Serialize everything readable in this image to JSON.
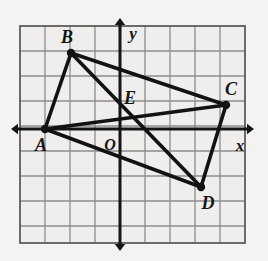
{
  "figure": {
    "kind": "coordinate-plane-quadrilateral",
    "background_color": "#f4f3f1",
    "grid": {
      "border_color": "#5d5d5d",
      "line_color": "#8d8d8d",
      "cell_size_px": 25,
      "left_px": 20,
      "top_px": 26,
      "right_px": 245,
      "bottom_px": 243,
      "columns": 9,
      "rows": 8,
      "show_grid": true
    },
    "axes": {
      "color": "#151515",
      "origin_px": {
        "x": 120,
        "y": 129
      },
      "origin_label": "O",
      "x_axis_label": "x",
      "y_axis_label": "y",
      "x_axis_y_px": 129,
      "y_axis_x_px": 120,
      "arrowheads": [
        "left",
        "right",
        "up",
        "down"
      ]
    },
    "points": [
      {
        "id": "A",
        "label": "A",
        "x_px": 45,
        "y_px": 129,
        "grid_x": -3,
        "grid_y": 0,
        "label_dx": -4,
        "label_dy": 22,
        "dot": true
      },
      {
        "id": "B",
        "label": "B",
        "x_px": 71,
        "y_px": 53,
        "grid_x": -2,
        "grid_y": 3,
        "label_dx": -4,
        "label_dy": -10,
        "dot": true
      },
      {
        "id": "C",
        "label": "C",
        "x_px": 226,
        "y_px": 105,
        "grid_x": 4.2,
        "grid_y": 1,
        "label_dx": 5,
        "label_dy": -10,
        "dot": true
      },
      {
        "id": "D",
        "label": "D",
        "x_px": 201,
        "y_px": 187,
        "grid_x": 3.2,
        "grid_y": -2.3,
        "label_dx": 7,
        "label_dy": 22,
        "dot": true
      },
      {
        "id": "E",
        "label": "E",
        "x_px": 140,
        "y_px": 110,
        "grid_x": 0.8,
        "grid_y": 0.75,
        "label_dx": -10,
        "label_dy": -6,
        "dot": false
      }
    ],
    "segments": [
      {
        "name": "side-AB",
        "from": "A",
        "to": "B"
      },
      {
        "name": "side-BC",
        "from": "B",
        "to": "C"
      },
      {
        "name": "side-CD",
        "from": "C",
        "to": "D"
      },
      {
        "name": "side-DA",
        "from": "D",
        "to": "A"
      },
      {
        "name": "diagonal-AC",
        "from": "A",
        "to": "C"
      },
      {
        "name": "diagonal-BD",
        "from": "B",
        "to": "D"
      }
    ],
    "segment_color": "#121212",
    "segment_width_px": 3.6,
    "point_radius_px": 4.2,
    "intersection_note": "Diagonals AC and BD meet at E"
  }
}
